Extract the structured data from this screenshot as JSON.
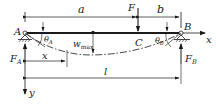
{
  "diagram": {
    "type": "simply-supported-beam-deflection",
    "colors": {
      "ink": "#1a1a1a",
      "background": "#ffffff"
    },
    "points": {
      "A": "A",
      "B": "B",
      "C": "C"
    },
    "load": {
      "label": "F"
    },
    "dimensions": {
      "a": "a",
      "b": "b",
      "x": "x",
      "l": "l"
    },
    "axes": {
      "x": "x",
      "y": "y"
    },
    "reactions": {
      "FA": {
        "main": "F",
        "sub": "A"
      },
      "FB": {
        "main": "F",
        "sub": "B"
      }
    },
    "angles": {
      "thetaA": {
        "main": "θ",
        "sub": "A"
      },
      "thetaB": {
        "main": "θ",
        "sub": "B"
      }
    },
    "deflection": {
      "main": "w",
      "sub": "max"
    }
  }
}
